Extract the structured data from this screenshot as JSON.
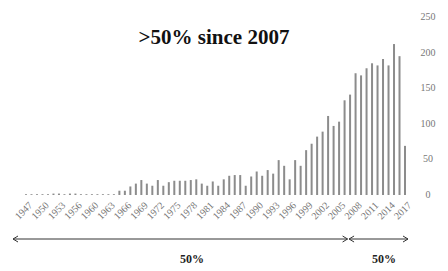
{
  "chart_data": {
    "type": "bar",
    "title": ">50% since 2007",
    "xlabel": "",
    "ylabel": "",
    "ylim": [
      0,
      250
    ],
    "yticks": [
      0,
      50,
      100,
      150,
      200,
      250
    ],
    "y_axis_side": "right",
    "grid": false,
    "legend": "none",
    "categories": [
      "1947",
      "1948",
      "1949",
      "1950",
      "1951",
      "1952",
      "1953",
      "1954",
      "1955",
      "1956",
      "1958",
      "1959",
      "1960",
      "1961",
      "1962",
      "1963",
      "1964",
      "1965",
      "1966",
      "1967",
      "1968",
      "1969",
      "1970",
      "1971",
      "1972",
      "1973",
      "1974",
      "1975",
      "1976",
      "1977",
      "1978",
      "1979",
      "1980",
      "1981",
      "1982",
      "1983",
      "1984",
      "1985",
      "1986",
      "1987",
      "1988",
      "1989",
      "1990",
      "1991",
      "1992",
      "1993",
      "1994",
      "1995",
      "1996",
      "1997",
      "1998",
      "1999",
      "2000",
      "2001",
      "2002",
      "2003",
      "2004",
      "2005",
      "2006",
      "2007",
      "2008",
      "2009",
      "2010",
      "2011",
      "2012",
      "2013",
      "2014",
      "2015",
      "2016",
      "2017"
    ],
    "values": [
      1,
      1,
      0,
      1,
      1,
      2,
      2,
      1,
      2,
      2,
      0,
      1,
      1,
      0,
      1,
      1,
      1,
      6,
      6,
      12,
      16,
      21,
      16,
      13,
      21,
      13,
      18,
      20,
      20,
      20,
      21,
      22,
      16,
      13,
      19,
      13,
      22,
      27,
      28,
      28,
      13,
      26,
      33,
      27,
      35,
      30,
      49,
      41,
      22,
      49,
      41,
      63,
      72,
      82,
      89,
      111,
      97,
      103,
      133,
      141,
      171,
      168,
      178,
      185,
      182,
      191,
      182,
      212,
      195,
      69
    ],
    "tick_labels": [
      "1947",
      "1950",
      "1953",
      "1956",
      "1960",
      "1963",
      "1966",
      "1969",
      "1972",
      "1975",
      "1978",
      "1981",
      "1984",
      "1987",
      "1990",
      "1993",
      "1996",
      "1999",
      "2002",
      "2005",
      "2008",
      "2011",
      "2014",
      "2017"
    ],
    "annotations": [
      {
        "label": "50%",
        "span": [
          "1947",
          "2006"
        ],
        "type": "double-arrow"
      },
      {
        "label": "50%",
        "span": [
          "2007",
          "2017"
        ],
        "type": "double-arrow"
      }
    ]
  }
}
